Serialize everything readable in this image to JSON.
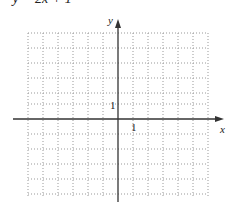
{
  "problem": {
    "equation": "• y = 2x + 1"
  },
  "graph": {
    "x_axis_label": "x",
    "y_axis_label": "y",
    "x_tick_label": "1",
    "y_tick_label": "1",
    "grid": "dotted",
    "grid_range": {
      "x": [
        -6,
        6
      ],
      "y": [
        -6,
        6
      ]
    },
    "axis_color": "#333333",
    "grid_color": "#999999"
  }
}
